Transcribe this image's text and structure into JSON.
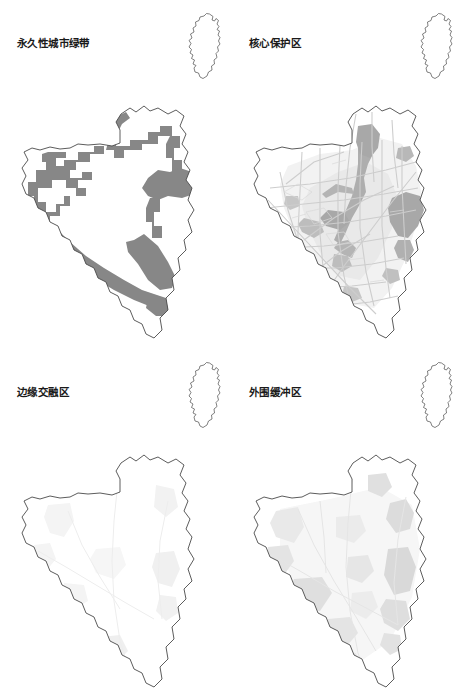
{
  "figure": {
    "type": "map-figure-grid",
    "rows": 2,
    "cols": 2,
    "background_color": "#ffffff",
    "outline_color": "#4a4a4a",
    "panel_count": 4
  },
  "palette": {
    "boundary_stroke": "#4a4a4a",
    "greenbelt_fill": "#878787",
    "core_zone_dark": "#a8a8a8",
    "core_zone_mid": "#c4c4c4",
    "road_network": "#cfcfcf",
    "urban_haze": "#efefef",
    "faint_feature": "#f0f0f0",
    "buffer_patch": "#e2e2e2",
    "title_color": "#1a1a1a"
  },
  "panels": [
    {
      "id": "permanent-urban-green-belt",
      "title": "永久性城市绿带",
      "position": "top-left",
      "inset_label": "locator-inset",
      "feature_style": "dark-gray-belt-band",
      "fill_color": "#878787",
      "description_of_fill": "continuous ring-shaped belt band following the western, northern, eastern and southern margins of the municipal boundary"
    },
    {
      "id": "core-protection-zone",
      "title": "核心保护区",
      "position": "top-right",
      "inset_label": "locator-inset",
      "feature_style": "urban-core-with-road-network",
      "fill_color": "#a8a8a8",
      "description_of_fill": "central river corridor and built-up urban blocks with dense road network lines across the basin"
    },
    {
      "id": "edge-integration-zone",
      "title": "边缘交融区",
      "position": "bottom-left",
      "inset_label": "locator-inset",
      "feature_style": "very-faint-scattered-patches",
      "fill_color": "#f0f0f0",
      "description_of_fill": "sparse, very light gray fragments scattered mainly along eastern and southern fringes"
    },
    {
      "id": "outer-buffer-zone",
      "title": "外围缓冲区",
      "position": "bottom-right",
      "feature_style": "light-gray-scattered-patches",
      "inset_label": "locator-inset",
      "fill_color": "#e2e2e2",
      "description_of_fill": "light gray patch clusters concentrated on the east flank, south-center and west-center of the boundary"
    }
  ]
}
